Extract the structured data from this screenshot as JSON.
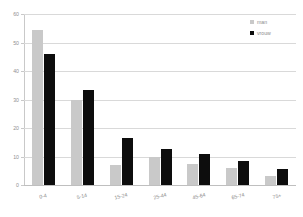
{
  "chart_data": {
    "type": "bar",
    "title": "",
    "xlabel": "",
    "ylabel": "",
    "ylim": [
      0,
      60
    ],
    "yticks": [
      0,
      10,
      20,
      30,
      40,
      50,
      60
    ],
    "grid": true,
    "legend_position": "top-right",
    "categories": [
      "0-4",
      "5-14",
      "15-24",
      "25-44",
      "45-64",
      "65-74",
      "75+"
    ],
    "series": [
      {
        "name": "man",
        "color": "#c9c9c9",
        "values": [
          54.5,
          30,
          7,
          10,
          7.5,
          6,
          3
        ]
      },
      {
        "name": "vrouw",
        "color": "#0d0d0d",
        "values": [
          46,
          33.5,
          16.5,
          12.5,
          11,
          8.5,
          5.5
        ]
      }
    ]
  },
  "legend": {
    "items": [
      {
        "label": "man",
        "swatch": "man"
      },
      {
        "label": "vrouw",
        "swatch": "vrouw"
      }
    ]
  }
}
